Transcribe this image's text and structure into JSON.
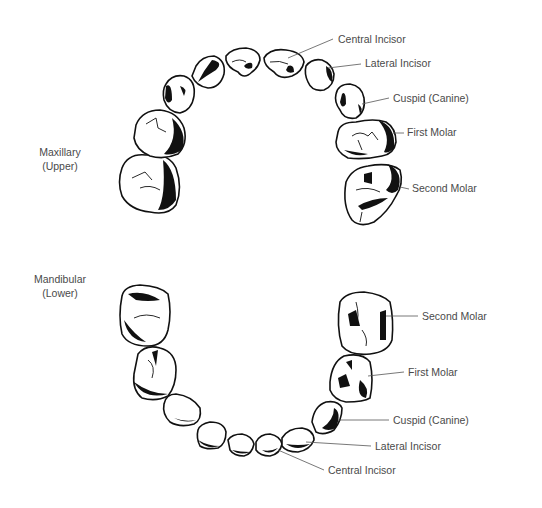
{
  "diagram": {
    "type": "dental arch illustration",
    "background": "#ffffff",
    "line_color": "#111111",
    "label_color": "#4a4a4a",
    "maxillary": {
      "title_line1": "Maxillary",
      "title_line2": "(Upper)",
      "labels": {
        "central_incisor": "Central Incisor",
        "lateral_incisor": "Lateral Incisor",
        "cuspid": "Cuspid (Canine)",
        "first_molar": "First Molar",
        "second_molar": "Second Molar"
      }
    },
    "mandibular": {
      "title_line1": "Mandibular",
      "title_line2": "(Lower)",
      "labels": {
        "second_molar": "Second Molar",
        "first_molar": "First Molar",
        "cuspid": "Cuspid (Canine)",
        "lateral_incisor": "Lateral Incisor",
        "central_incisor": "Central Incisor"
      }
    }
  }
}
